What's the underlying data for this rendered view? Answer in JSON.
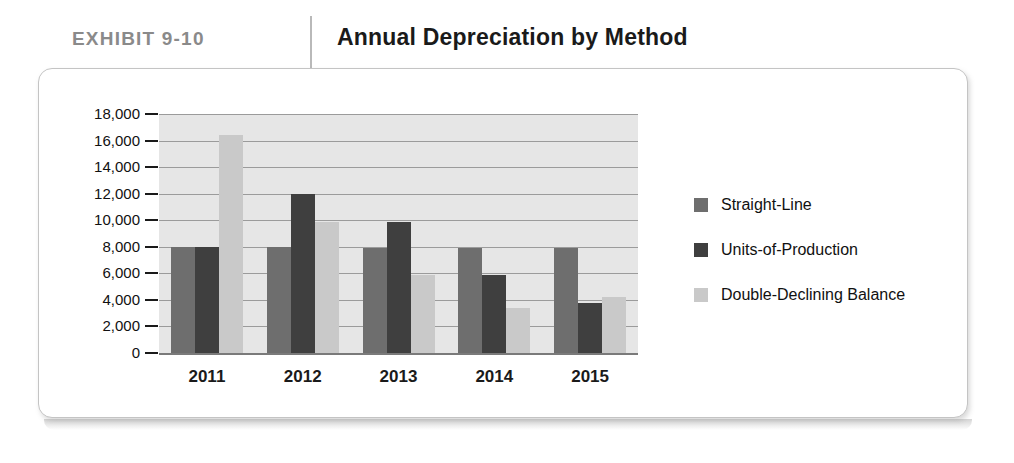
{
  "header": {
    "exhibit_label": "EXHIBIT  9-10",
    "title": "Annual Depreciation by Method",
    "label_color": "#8a8a8a",
    "title_color": "#1a1a1a"
  },
  "chart_data": {
    "type": "bar",
    "title": "Annual Depreciation by Method",
    "xlabel": "",
    "ylabel": "",
    "categories": [
      "2011",
      "2012",
      "2013",
      "2014",
      "2015"
    ],
    "ylim": [
      0,
      18000
    ],
    "ytick_labels": [
      "18,000",
      "16,000",
      "14,000",
      "12,000",
      "10,000",
      "8,000",
      "6,000",
      "4,000",
      "2,000",
      "0"
    ],
    "ytick_values": [
      18000,
      16000,
      14000,
      12000,
      10000,
      8000,
      6000,
      4000,
      2000,
      0
    ],
    "grid": true,
    "grid_axis": "y",
    "legend_position": "right",
    "plot_background": "#e6e6e6",
    "series": [
      {
        "name": "Straight-Line",
        "color": "#6e6e6e",
        "values": [
          8000,
          8000,
          7900,
          7900,
          7900
        ]
      },
      {
        "name": "Units-of-Production",
        "color": "#3f3f3f",
        "values": [
          8000,
          12000,
          9900,
          5900,
          3800
        ]
      },
      {
        "name": "Double-Declining Balance",
        "color": "#c9c9c9",
        "values": [
          16400,
          9900,
          5900,
          3400,
          4200
        ]
      }
    ]
  }
}
